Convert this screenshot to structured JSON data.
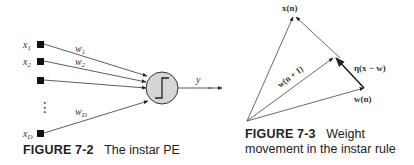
{
  "figure_7_2": {
    "inputs": [
      {
        "label": "x",
        "sub": "1"
      },
      {
        "label": "x",
        "sub": "2"
      },
      {
        "label": "",
        "sub": ""
      },
      {
        "label": "x",
        "sub": "D"
      }
    ],
    "weights": [
      {
        "label": "w",
        "sub": "1"
      },
      {
        "label": "w",
        "sub": "2"
      },
      {
        "label": "w",
        "sub": "D"
      }
    ],
    "ellipsis": "⋮",
    "output_label": "y",
    "caption_number": "FIGURE 7-2",
    "caption_text": "The instar PE",
    "colors": {
      "node_fill": "#d6d6d6",
      "stroke": "#333333",
      "input_box": "#111111"
    }
  },
  "figure_7_3": {
    "vector_labels": {
      "x": "x(n)",
      "w_next": "w(n + 1)",
      "w": "w(n)",
      "delta": "η(x − w)"
    },
    "caption_number": "FIGURE 7-3",
    "caption_text_line1": "Weight",
    "caption_text_line2": "movement in the instar rule"
  }
}
